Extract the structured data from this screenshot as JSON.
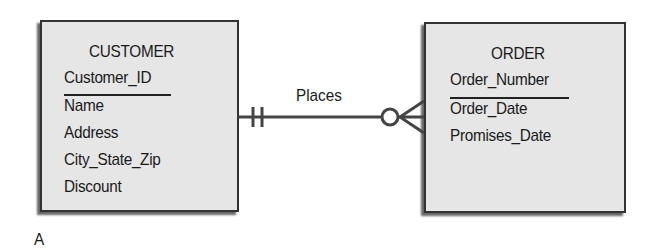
{
  "diagram": {
    "type": "entity-relationship",
    "notation": "crows-foot",
    "entities": [
      {
        "name": "CUSTOMER",
        "primary_key": "Customer_ID",
        "attributes": [
          "Name",
          "Address",
          "City_State_Zip",
          "Discount"
        ]
      },
      {
        "name": "ORDER",
        "primary_key": "Order_Number",
        "attributes": [
          "Order_Date",
          "Promises_Date"
        ]
      }
    ],
    "relationship": {
      "label": "Places",
      "from": "CUSTOMER",
      "to": "ORDER",
      "from_cardinality": "one-and-only-one",
      "to_cardinality": "zero-or-many"
    },
    "caption": "A"
  }
}
